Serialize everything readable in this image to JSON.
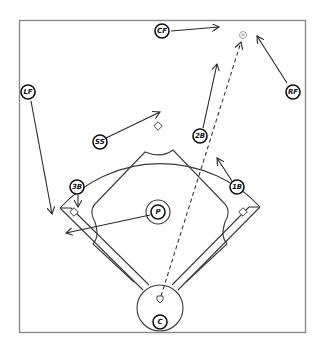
{
  "diagram": {
    "colors": {
      "line": "#3a3a3a",
      "frame": "#8a8a8a",
      "background": "#ffffff"
    },
    "positions": [
      {
        "id": "cf",
        "label": "CF"
      },
      {
        "id": "lf",
        "label": "LF"
      },
      {
        "id": "rf",
        "label": "RF"
      },
      {
        "id": "ss",
        "label": "SS"
      },
      {
        "id": "2b",
        "label": "2B"
      },
      {
        "id": "3b",
        "label": "3B"
      },
      {
        "id": "1b",
        "label": "1B"
      },
      {
        "id": "p",
        "label": "P"
      },
      {
        "id": "c",
        "label": "C"
      }
    ],
    "bases": [
      "first-base",
      "second-base",
      "third-base",
      "home-plate"
    ],
    "ball_marker": "ball-icon",
    "ball_path": "dashed"
  }
}
